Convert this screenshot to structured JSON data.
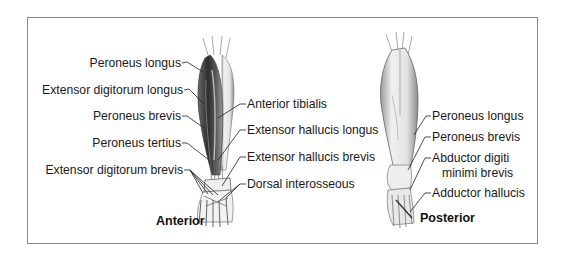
{
  "figure": {
    "views": [
      {
        "title": "Anterior",
        "labels_left": [
          "Peroneus longus",
          "Extensor digitorum longus",
          "Peroneus brevis",
          "Peroneus tertius",
          "Extensor digitorum brevis"
        ],
        "labels_right": [
          "Anterior tibialis",
          "Extensor hallucis longus",
          "Extensor hallucis brevis",
          "Dorsal interosseous"
        ]
      },
      {
        "title": "Posterior",
        "labels": [
          "Peroneus longus",
          "Peroneus brevis",
          "Abductor digiti",
          "minimi brevis",
          "Adductor hallucis"
        ]
      }
    ]
  },
  "colors": {
    "frame_border": "#8a8a8a",
    "text": "#1a1a1a",
    "muscle_dark": "#3a3a3a",
    "muscle_light": "#d8d8d8"
  }
}
